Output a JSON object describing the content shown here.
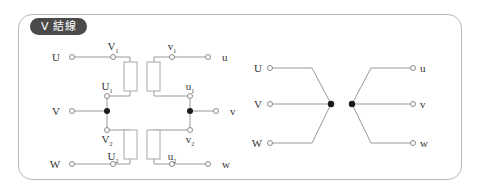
{
  "panel": {
    "title": "V 結線",
    "border_color": "#b8b8b8",
    "badge_color": "#4a4a4a",
    "background": "#ffffff"
  },
  "colors": {
    "wire": "#9a9a9a",
    "coil_stroke": "#a8a8a8",
    "node_fill": "#1a1a1a",
    "terminal_stroke": "#8a8a8a",
    "text": "#333333"
  },
  "winding_diagram": {
    "name": "detailed-winding-diagram",
    "primary_terminals": [
      {
        "id": "U",
        "label": "U",
        "y": 57
      },
      {
        "id": "V",
        "label": "V",
        "y": 111
      },
      {
        "id": "W",
        "label": "W",
        "y": 164
      }
    ],
    "secondary_terminals": [
      {
        "id": "u",
        "label": "u",
        "y": 57
      },
      {
        "id": "v",
        "label": "v",
        "y": 111
      },
      {
        "id": "w",
        "label": "w",
        "y": 164
      }
    ],
    "tap_labels": [
      {
        "id": "V1",
        "base": "V",
        "sub": "1",
        "x": 113,
        "y": 50,
        "side": "primary"
      },
      {
        "id": "U1",
        "base": "U",
        "sub": "1",
        "x": 113,
        "y": 90,
        "side": "primary"
      },
      {
        "id": "V2",
        "base": "V",
        "sub": "2",
        "x": 113,
        "y": 141,
        "side": "primary"
      },
      {
        "id": "U2",
        "base": "U",
        "sub": "2",
        "x": 113,
        "y": 160,
        "side": "primary"
      },
      {
        "id": "v1",
        "base": "v",
        "sub": "1",
        "x": 172,
        "y": 50,
        "side": "secondary"
      },
      {
        "id": "u1",
        "base": "u",
        "sub": "1",
        "x": 178,
        "y": 90,
        "side": "secondary"
      },
      {
        "id": "v2",
        "base": "v",
        "sub": "2",
        "x": 178,
        "y": 141,
        "side": "secondary"
      },
      {
        "id": "u2",
        "base": "u",
        "sub": "2",
        "x": 172,
        "y": 160,
        "side": "secondary"
      }
    ],
    "coils": [
      {
        "id": "coil-primary-upper",
        "x": 124,
        "y": 62,
        "w": 13,
        "h": 29
      },
      {
        "id": "coil-secondary-upper",
        "x": 147,
        "y": 62,
        "w": 13,
        "h": 29
      },
      {
        "id": "coil-primary-lower",
        "x": 124,
        "y": 130,
        "w": 13,
        "h": 29
      },
      {
        "id": "coil-secondary-lower",
        "x": 147,
        "y": 130,
        "w": 13,
        "h": 29
      }
    ],
    "junction_nodes": [
      {
        "id": "node-primary-neutral",
        "cx": 107,
        "cy": 111
      },
      {
        "id": "node-secondary-neutral",
        "cx": 190,
        "cy": 111
      }
    ]
  },
  "chevron_diagram": {
    "name": "simplified-v-connection-diagram",
    "primary_terminals": [
      {
        "id": "U",
        "label": "U",
        "x": 258,
        "y": 68
      },
      {
        "id": "V",
        "label": "V",
        "x": 258,
        "y": 104
      },
      {
        "id": "W",
        "label": "W",
        "x": 258,
        "y": 143
      }
    ],
    "secondary_terminals": [
      {
        "id": "u",
        "label": "u",
        "x": 425,
        "y": 68
      },
      {
        "id": "v",
        "label": "v",
        "x": 425,
        "y": 104
      },
      {
        "id": "w",
        "label": "w",
        "x": 425,
        "y": 143
      }
    ],
    "junction_nodes": [
      {
        "id": "node-left-vertex",
        "cx": 331,
        "cy": 104
      },
      {
        "id": "node-right-vertex",
        "cx": 352,
        "cy": 104
      }
    ]
  }
}
